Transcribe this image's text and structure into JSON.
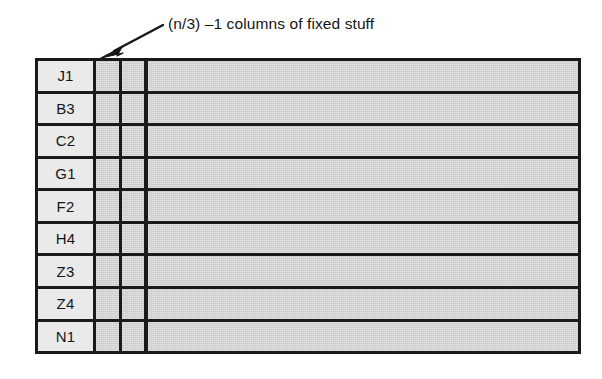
{
  "annotation": {
    "caption": "(n/3) –1 columns of fixed stuff",
    "arrow_icon": "arrow-down-left-icon"
  },
  "grid": {
    "columns": [
      {
        "key": "label",
        "type": "row-label"
      },
      {
        "key": "fixed_1",
        "type": "fixed"
      },
      {
        "key": "fixed_2",
        "type": "fixed"
      },
      {
        "key": "variable",
        "type": "wide"
      }
    ],
    "rows": [
      {
        "label": "J1"
      },
      {
        "label": "B3"
      },
      {
        "label": "C2"
      },
      {
        "label": "G1"
      },
      {
        "label": "F2"
      },
      {
        "label": "H4"
      },
      {
        "label": "Z3"
      },
      {
        "label": "Z4"
      },
      {
        "label": "N1"
      }
    ]
  },
  "colors": {
    "cell_fill": "#c9c9c9",
    "label_fill": "#e9e9e9",
    "line": "#1a1a1a",
    "background": "#ffffff"
  }
}
